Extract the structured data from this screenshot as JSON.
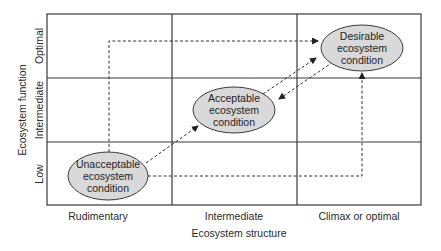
{
  "diagram": {
    "x_axis": {
      "title": "Ecosystem structure",
      "categories": [
        "Rudimentary",
        "Intermediate",
        "Climax or optimal"
      ]
    },
    "y_axis": {
      "title": "Ecosystem function",
      "categories": [
        "Low",
        "Intermediate",
        "Optimal"
      ]
    },
    "nodes": [
      {
        "id": "unacceptable",
        "lines": [
          "Unacceptable",
          "ecosystem",
          "condition"
        ],
        "column": "Rudimentary",
        "row": "Low"
      },
      {
        "id": "acceptable",
        "lines": [
          "Acceptable",
          "ecosystem",
          "condition"
        ],
        "column": "Intermediate",
        "row": "Intermediate"
      },
      {
        "id": "desirable",
        "lines": [
          "Desirable",
          "ecosystem",
          "condition"
        ],
        "column": "Climax or optimal",
        "row": "Optimal"
      }
    ],
    "edges": [
      {
        "from": "unacceptable",
        "to": "desirable",
        "route": "up then right",
        "style": "dashed"
      },
      {
        "from": "unacceptable",
        "to": "desirable",
        "route": "right then up",
        "style": "dashed"
      },
      {
        "from": "unacceptable",
        "to": "acceptable",
        "route": "diagonal",
        "style": "dashed"
      },
      {
        "from": "acceptable",
        "to": "desirable",
        "route": "diagonal",
        "style": "dashed"
      },
      {
        "from": "desirable",
        "to": "acceptable",
        "route": "diagonal",
        "style": "dashed"
      }
    ],
    "colors": {
      "node_fill": "#d9d9d9",
      "node_stroke": "#3a3a3a",
      "grid": "#3a3a3a",
      "arrow": "#333333"
    }
  }
}
